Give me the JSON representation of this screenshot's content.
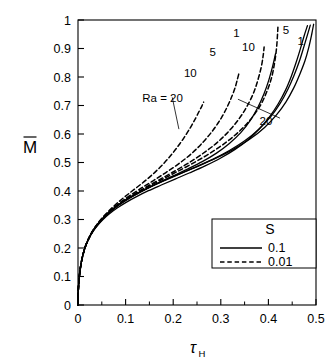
{
  "chart_data": {
    "type": "line",
    "title": "",
    "xlabel": "τ",
    "xlabel_sub": "H",
    "ylabel": "M",
    "ylabel_overbar": true,
    "xlim": [
      0,
      0.5
    ],
    "ylim": [
      0,
      1
    ],
    "xticks": [
      0,
      0.1,
      0.2,
      0.3,
      0.4,
      0.5
    ],
    "xticklabels": [
      "0",
      "0.1",
      "0.2",
      "0.3",
      "0.4",
      "0.5"
    ],
    "xminorticks": [
      0.05,
      0.15,
      0.25,
      0.35,
      0.45
    ],
    "yticks": [
      0,
      0.1,
      0.2,
      0.3,
      0.4,
      0.5,
      0.6,
      0.7,
      0.8,
      0.9,
      1
    ],
    "yticklabels": [
      "0",
      "0.1",
      "0.2",
      "0.3",
      "0.4",
      "0.5",
      "0.6",
      "0.7",
      "0.8",
      "0.9",
      "1"
    ],
    "grid": false,
    "frame": true,
    "line_color": "#000000",
    "annotations": [
      {
        "name": "ra-equals-20",
        "text": "Ra  =  20",
        "x": 0.135,
        "y": 0.725,
        "leader_to": [
          0.212,
          0.617
        ]
      },
      {
        "name": "dashed-10",
        "text": "10",
        "x": 0.236,
        "y": 0.815
      },
      {
        "name": "dashed-5",
        "text": "5",
        "x": 0.283,
        "y": 0.888
      },
      {
        "name": "dashed-1",
        "text": "1",
        "x": 0.333,
        "y": 0.955
      },
      {
        "name": "solid-10",
        "text": "10",
        "x": 0.358,
        "y": 0.905
      },
      {
        "name": "solid-5",
        "text": "5",
        "x": 0.437,
        "y": 0.965
      },
      {
        "name": "solid-1",
        "text": "1",
        "x": 0.468,
        "y": 0.925
      },
      {
        "name": "solid-20",
        "text": "20",
        "x": 0.395,
        "y": 0.645,
        "leader_to": [
          0.336,
          0.722
        ]
      }
    ],
    "series": [
      {
        "name": "Ra = 20, S = 0.01",
        "Ra": 20,
        "S": 0.01,
        "style": "dashed",
        "points": [
          [
            0.0,
            0.0
          ],
          [
            0.0008,
            0.055
          ],
          [
            0.002,
            0.085
          ],
          [
            0.004,
            0.118
          ],
          [
            0.007,
            0.15
          ],
          [
            0.011,
            0.18
          ],
          [
            0.016,
            0.208
          ],
          [
            0.022,
            0.232
          ],
          [
            0.03,
            0.258
          ],
          [
            0.04,
            0.283
          ],
          [
            0.052,
            0.308
          ],
          [
            0.066,
            0.332
          ],
          [
            0.082,
            0.357
          ],
          [
            0.1,
            0.382
          ],
          [
            0.12,
            0.408
          ],
          [
            0.142,
            0.437
          ],
          [
            0.163,
            0.468
          ],
          [
            0.182,
            0.5
          ],
          [
            0.199,
            0.533
          ],
          [
            0.214,
            0.566
          ],
          [
            0.227,
            0.598
          ],
          [
            0.238,
            0.628
          ],
          [
            0.247,
            0.655
          ],
          [
            0.254,
            0.678
          ],
          [
            0.26,
            0.697
          ],
          [
            0.264,
            0.712
          ]
        ]
      },
      {
        "name": "Ra = 10, S = 0.01",
        "Ra": 10,
        "S": 0.01,
        "style": "dashed",
        "points": [
          [
            0.0,
            0.0
          ],
          [
            0.0008,
            0.055
          ],
          [
            0.002,
            0.085
          ],
          [
            0.004,
            0.118
          ],
          [
            0.007,
            0.15
          ],
          [
            0.011,
            0.18
          ],
          [
            0.016,
            0.208
          ],
          [
            0.023,
            0.234
          ],
          [
            0.031,
            0.26
          ],
          [
            0.042,
            0.286
          ],
          [
            0.055,
            0.311
          ],
          [
            0.07,
            0.335
          ],
          [
            0.088,
            0.359
          ],
          [
            0.108,
            0.383
          ],
          [
            0.131,
            0.408
          ],
          [
            0.157,
            0.435
          ],
          [
            0.184,
            0.464
          ],
          [
            0.212,
            0.496
          ],
          [
            0.239,
            0.532
          ],
          [
            0.263,
            0.572
          ],
          [
            0.284,
            0.614
          ],
          [
            0.301,
            0.656
          ],
          [
            0.314,
            0.697
          ],
          [
            0.324,
            0.735
          ],
          [
            0.331,
            0.768
          ],
          [
            0.335,
            0.793
          ],
          [
            0.338,
            0.812
          ]
        ]
      },
      {
        "name": "Ra = 5, S = 0.01",
        "Ra": 5,
        "S": 0.01,
        "style": "dashed",
        "points": [
          [
            0.0,
            0.0
          ],
          [
            0.0008,
            0.055
          ],
          [
            0.002,
            0.085
          ],
          [
            0.004,
            0.118
          ],
          [
            0.007,
            0.15
          ],
          [
            0.011,
            0.18
          ],
          [
            0.016,
            0.208
          ],
          [
            0.023,
            0.234
          ],
          [
            0.032,
            0.261
          ],
          [
            0.043,
            0.287
          ],
          [
            0.057,
            0.312
          ],
          [
            0.073,
            0.337
          ],
          [
            0.092,
            0.361
          ],
          [
            0.114,
            0.385
          ],
          [
            0.139,
            0.41
          ],
          [
            0.167,
            0.436
          ],
          [
            0.197,
            0.464
          ],
          [
            0.229,
            0.495
          ],
          [
            0.261,
            0.53
          ],
          [
            0.291,
            0.568
          ],
          [
            0.317,
            0.61
          ],
          [
            0.339,
            0.655
          ],
          [
            0.356,
            0.7
          ],
          [
            0.369,
            0.745
          ],
          [
            0.378,
            0.79
          ],
          [
            0.385,
            0.835
          ],
          [
            0.389,
            0.875
          ],
          [
            0.391,
            0.905
          ]
        ]
      },
      {
        "name": "Ra = 1, S = 0.01",
        "Ra": 1,
        "S": 0.01,
        "style": "dashed",
        "points": [
          [
            0.0,
            0.0
          ],
          [
            0.0008,
            0.055
          ],
          [
            0.002,
            0.085
          ],
          [
            0.004,
            0.118
          ],
          [
            0.007,
            0.15
          ],
          [
            0.011,
            0.18
          ],
          [
            0.016,
            0.208
          ],
          [
            0.023,
            0.235
          ],
          [
            0.032,
            0.262
          ],
          [
            0.044,
            0.288
          ],
          [
            0.058,
            0.314
          ],
          [
            0.075,
            0.339
          ],
          [
            0.095,
            0.363
          ],
          [
            0.118,
            0.387
          ],
          [
            0.144,
            0.412
          ],
          [
            0.174,
            0.438
          ],
          [
            0.206,
            0.466
          ],
          [
            0.24,
            0.496
          ],
          [
            0.275,
            0.53
          ],
          [
            0.308,
            0.567
          ],
          [
            0.338,
            0.608
          ],
          [
            0.363,
            0.652
          ],
          [
            0.383,
            0.7
          ],
          [
            0.397,
            0.75
          ],
          [
            0.407,
            0.8
          ],
          [
            0.413,
            0.85
          ],
          [
            0.417,
            0.9
          ],
          [
            0.419,
            0.945
          ],
          [
            0.42,
            0.975
          ]
        ]
      },
      {
        "name": "Ra = 20, S = 0.1",
        "Ra": 20,
        "S": 0.1,
        "style": "solid",
        "points": [
          [
            0.0,
            0.0
          ],
          [
            0.0008,
            0.055
          ],
          [
            0.002,
            0.085
          ],
          [
            0.004,
            0.118
          ],
          [
            0.007,
            0.15
          ],
          [
            0.011,
            0.18
          ],
          [
            0.016,
            0.206
          ],
          [
            0.022,
            0.23
          ],
          [
            0.03,
            0.254
          ],
          [
            0.04,
            0.277
          ],
          [
            0.052,
            0.299
          ],
          [
            0.066,
            0.32
          ],
          [
            0.083,
            0.341
          ],
          [
            0.102,
            0.361
          ],
          [
            0.124,
            0.381
          ],
          [
            0.148,
            0.401
          ],
          [
            0.175,
            0.421
          ],
          [
            0.204,
            0.442
          ],
          [
            0.235,
            0.464
          ],
          [
            0.267,
            0.488
          ],
          [
            0.299,
            0.515
          ],
          [
            0.33,
            0.546
          ],
          [
            0.358,
            0.581
          ],
          [
            0.382,
            0.62
          ],
          [
            0.403,
            0.662
          ],
          [
            0.421,
            0.707
          ],
          [
            0.436,
            0.754
          ],
          [
            0.448,
            0.802
          ],
          [
            0.458,
            0.85
          ],
          [
            0.467,
            0.898
          ],
          [
            0.475,
            0.944
          ],
          [
            0.482,
            0.98
          ]
        ]
      },
      {
        "name": "Ra = 10, S = 0.1",
        "Ra": 10,
        "S": 0.1,
        "style": "solid",
        "points": [
          [
            0.0,
            0.0
          ],
          [
            0.0008,
            0.055
          ],
          [
            0.002,
            0.085
          ],
          [
            0.004,
            0.118
          ],
          [
            0.007,
            0.15
          ],
          [
            0.011,
            0.18
          ],
          [
            0.016,
            0.207
          ],
          [
            0.022,
            0.231
          ],
          [
            0.03,
            0.256
          ],
          [
            0.04,
            0.279
          ],
          [
            0.052,
            0.302
          ],
          [
            0.066,
            0.324
          ],
          [
            0.082,
            0.346
          ],
          [
            0.101,
            0.367
          ],
          [
            0.122,
            0.388
          ],
          [
            0.146,
            0.409
          ],
          [
            0.172,
            0.431
          ],
          [
            0.2,
            0.453
          ],
          [
            0.23,
            0.477
          ],
          [
            0.261,
            0.503
          ],
          [
            0.291,
            0.533
          ],
          [
            0.318,
            0.567
          ],
          [
            0.342,
            0.605
          ],
          [
            0.362,
            0.648
          ],
          [
            0.378,
            0.694
          ],
          [
            0.391,
            0.742
          ],
          [
            0.401,
            0.79
          ],
          [
            0.409,
            0.838
          ],
          [
            0.415,
            0.882
          ]
        ]
      },
      {
        "name": "Ra = 5, S = 0.1",
        "Ra": 5,
        "S": 0.1,
        "style": "solid",
        "points": [
          [
            0.0,
            0.0
          ],
          [
            0.0008,
            0.055
          ],
          [
            0.002,
            0.085
          ],
          [
            0.004,
            0.118
          ],
          [
            0.007,
            0.15
          ],
          [
            0.011,
            0.18
          ],
          [
            0.016,
            0.207
          ],
          [
            0.022,
            0.232
          ],
          [
            0.03,
            0.257
          ],
          [
            0.04,
            0.281
          ],
          [
            0.052,
            0.304
          ],
          [
            0.066,
            0.327
          ],
          [
            0.083,
            0.349
          ],
          [
            0.103,
            0.371
          ],
          [
            0.126,
            0.392
          ],
          [
            0.152,
            0.414
          ],
          [
            0.181,
            0.436
          ],
          [
            0.213,
            0.459
          ],
          [
            0.247,
            0.484
          ],
          [
            0.283,
            0.511
          ],
          [
            0.318,
            0.542
          ],
          [
            0.351,
            0.577
          ],
          [
            0.38,
            0.617
          ],
          [
            0.405,
            0.661
          ],
          [
            0.425,
            0.708
          ],
          [
            0.441,
            0.757
          ],
          [
            0.454,
            0.806
          ],
          [
            0.465,
            0.855
          ],
          [
            0.474,
            0.903
          ],
          [
            0.482,
            0.948
          ],
          [
            0.488,
            0.982
          ]
        ]
      },
      {
        "name": "Ra = 1, S = 0.1",
        "Ra": 1,
        "S": 0.1,
        "style": "solid",
        "points": [
          [
            0.0,
            0.0
          ],
          [
            0.0008,
            0.055
          ],
          [
            0.002,
            0.085
          ],
          [
            0.004,
            0.118
          ],
          [
            0.007,
            0.15
          ],
          [
            0.011,
            0.18
          ],
          [
            0.016,
            0.207
          ],
          [
            0.022,
            0.232
          ],
          [
            0.03,
            0.258
          ],
          [
            0.04,
            0.282
          ],
          [
            0.053,
            0.306
          ],
          [
            0.067,
            0.329
          ],
          [
            0.085,
            0.352
          ],
          [
            0.105,
            0.374
          ],
          [
            0.129,
            0.396
          ],
          [
            0.156,
            0.418
          ],
          [
            0.186,
            0.441
          ],
          [
            0.219,
            0.464
          ],
          [
            0.255,
            0.489
          ],
          [
            0.292,
            0.517
          ],
          [
            0.328,
            0.548
          ],
          [
            0.362,
            0.583
          ],
          [
            0.392,
            0.623
          ],
          [
            0.417,
            0.667
          ],
          [
            0.437,
            0.713
          ],
          [
            0.453,
            0.761
          ],
          [
            0.466,
            0.81
          ],
          [
            0.477,
            0.858
          ],
          [
            0.485,
            0.905
          ],
          [
            0.491,
            0.95
          ],
          [
            0.495,
            0.985
          ]
        ]
      }
    ],
    "legend": {
      "position": "lower-right",
      "title": "S",
      "entries": [
        {
          "label": "0.1",
          "style": "solid"
        },
        {
          "label": "0.01",
          "style": "dashed"
        }
      ]
    }
  }
}
